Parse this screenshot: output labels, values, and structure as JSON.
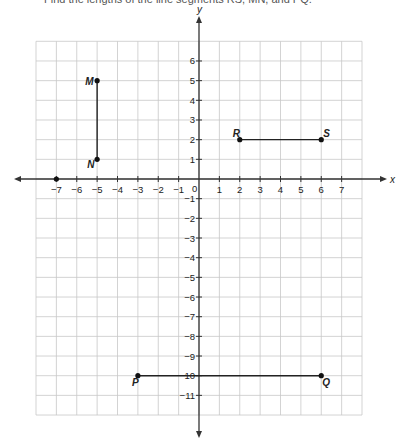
{
  "prompt": "Find the lengths of the line segments RS, MN, and PQ.",
  "chart_data": {
    "type": "scatter",
    "title": "",
    "xlabel": "x",
    "ylabel": "y",
    "xlim": [
      -8,
      8
    ],
    "ylim": [
      -12,
      7
    ],
    "grid": true,
    "x_ticks": [
      -7,
      -6,
      -5,
      -4,
      -3,
      -2,
      -1,
      0,
      1,
      2,
      3,
      4,
      5,
      6,
      7
    ],
    "y_ticks": [
      6,
      5,
      4,
      3,
      2,
      1,
      -1,
      -2,
      -3,
      -4,
      -5,
      -6,
      -7,
      -8,
      -9,
      -10,
      -11
    ],
    "points": [
      {
        "label": "M",
        "x": -5,
        "y": 5
      },
      {
        "label": "N",
        "x": -5,
        "y": 1
      },
      {
        "label": "R",
        "x": 2,
        "y": 2
      },
      {
        "label": "S",
        "x": 6,
        "y": 2
      },
      {
        "label": "P",
        "x": -3,
        "y": -10
      },
      {
        "label": "Q",
        "x": 6,
        "y": -10
      },
      {
        "label": "",
        "x": -7,
        "y": 0
      }
    ],
    "segments": [
      {
        "name": "MN",
        "from": "M",
        "to": "N"
      },
      {
        "name": "RS",
        "from": "R",
        "to": "S"
      },
      {
        "name": "PQ",
        "from": "P",
        "to": "Q"
      }
    ]
  },
  "colors": {
    "grid": "#c8c8c8",
    "axis": "#333333",
    "segment": "#222222",
    "point": "#111111"
  }
}
